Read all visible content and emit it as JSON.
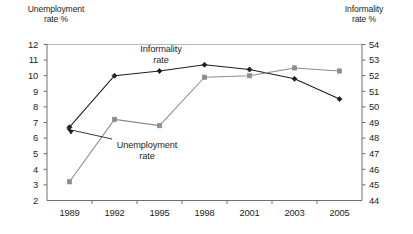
{
  "chart_data": {
    "type": "line",
    "title": "",
    "categories": [
      "1989",
      "1992",
      "1995",
      "1998",
      "2001",
      "2003",
      "2005"
    ],
    "grid": false,
    "legend_position": "inline-annotations",
    "axes": {
      "left": {
        "label": "Unemployment\nrate %",
        "ylim": [
          2,
          12
        ],
        "ticks": [
          "2",
          "3",
          "4",
          "5",
          "6",
          "7",
          "8",
          "9",
          "10",
          "11",
          "12"
        ]
      },
      "right": {
        "label": "Informality\nrate %",
        "ylim": [
          44,
          54
        ],
        "ticks": [
          "44",
          "45",
          "46",
          "47",
          "48",
          "49",
          "50",
          "51",
          "52",
          "53",
          "54"
        ]
      },
      "x": {
        "label": "",
        "ticks": [
          "1989",
          "1992",
          "1995",
          "1998",
          "2001",
          "2003",
          "2005"
        ]
      }
    },
    "series": [
      {
        "name": "Informality rate",
        "axis": "right",
        "color": "#221f1f",
        "marker": "diamond",
        "annotation": "Informality\nrate",
        "values": [
          48.7,
          52.0,
          52.3,
          52.7,
          52.4,
          51.8,
          50.5
        ]
      },
      {
        "name": "Unemployment rate",
        "axis": "left",
        "color": "#8c8c8c",
        "marker": "square",
        "annotation": "Unemployment\nrate",
        "values": [
          3.2,
          7.2,
          6.8,
          9.9,
          10.0,
          10.5,
          10.3
        ]
      }
    ]
  }
}
